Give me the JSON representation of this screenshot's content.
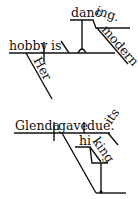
{
  "diagram": {
    "type": "sentence-diagram",
    "sentences": [
      {
        "id": "top",
        "words": {
          "subject": "hobby",
          "verb": "is",
          "subject_modifier": "Her",
          "complement_stem": "danc",
          "complement_suffix": "ing.",
          "complement_modifier": "modern"
        }
      },
      {
        "id": "bottom",
        "words": {
          "subject": "Glenda",
          "verb": "gave",
          "object": "due.",
          "object_modifier": "its",
          "indirect_stem": "hi",
          "indirect_suffix": "king"
        }
      }
    ],
    "colors": {
      "ink": "#111111",
      "background": "#ffffff"
    }
  }
}
